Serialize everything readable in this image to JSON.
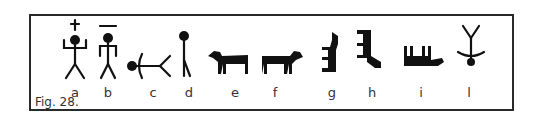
{
  "figure": {
    "caption": "Fig. 28.",
    "glyphs": [
      {
        "label": "a",
        "icon": "human-figure-arms-raised-with-cross-icon"
      },
      {
        "label": "b",
        "icon": "human-figure-with-bar-above-icon"
      },
      {
        "label": "c",
        "icon": "reclining-figure-icon"
      },
      {
        "label": "d",
        "icon": "standing-stick-figure-icon"
      },
      {
        "label": "e",
        "icon": "quadruped-animal-icon"
      },
      {
        "label": "f",
        "icon": "quadruped-animal-icon"
      },
      {
        "label": "g",
        "icon": "upright-animal-icon"
      },
      {
        "label": "h",
        "icon": "upright-animal-icon"
      },
      {
        "label": "i",
        "icon": "inverted-animal-icon"
      },
      {
        "label": "l",
        "icon": "inverted-figure-icon"
      }
    ]
  },
  "colors": {
    "ink": "#111111",
    "frame": "#2a2a2a",
    "text": "#333333"
  }
}
